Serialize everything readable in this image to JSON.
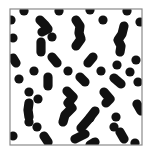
{
  "figure": {
    "kind": "pattern-panel",
    "background_color": "#ffffff",
    "blob_color": "#111111",
    "frame_color": "#8a8a8a",
    "frame": {
      "x": 10,
      "y": 9,
      "width": 132,
      "height": 136
    },
    "blob_radius": 4.6,
    "dots": [
      [
        24,
        11
      ],
      [
        59,
        11
      ],
      [
        90,
        10
      ],
      [
        127,
        11
      ],
      [
        11,
        20
      ],
      [
        13,
        38
      ],
      [
        52,
        37
      ],
      [
        103,
        20
      ],
      [
        140,
        22
      ],
      [
        34,
        71
      ],
      [
        19,
        79
      ],
      [
        68,
        71
      ],
      [
        117,
        65
      ],
      [
        136,
        60
      ],
      [
        130,
        72
      ],
      [
        101,
        71
      ],
      [
        138,
        82
      ],
      [
        29,
        92
      ],
      [
        38,
        99
      ],
      [
        116,
        117
      ],
      [
        90,
        118
      ],
      [
        29,
        122
      ],
      [
        37,
        127
      ],
      [
        13,
        136
      ],
      [
        135,
        143
      ],
      [
        114,
        127
      ]
    ],
    "chains": [
      [
        [
          40,
          20
        ],
        [
          45,
          25
        ],
        [
          48,
          29
        ],
        [
          42,
          32
        ]
      ],
      [
        [
          41,
          42
        ],
        [
          41,
          52
        ]
      ],
      [
        [
          76,
          20
        ],
        [
          80,
          26
        ],
        [
          79,
          33
        ],
        [
          81,
          39
        ],
        [
          76,
          46
        ]
      ],
      [
        [
          124,
          26
        ],
        [
          122,
          34
        ],
        [
          118,
          40
        ],
        [
          121,
          46
        ],
        [
          120,
          52
        ]
      ],
      [
        [
          13,
          58
        ],
        [
          16,
          63
        ]
      ],
      [
        [
          52,
          57
        ],
        [
          57,
          63
        ]
      ],
      [
        [
          93,
          57
        ],
        [
          88,
          63
        ]
      ],
      [
        [
          48,
          77
        ],
        [
          48,
          86
        ]
      ],
      [
        [
          80,
          77
        ],
        [
          85,
          82
        ]
      ],
      [
        [
          114,
          78
        ],
        [
          121,
          84
        ]
      ],
      [
        [
          67,
          91
        ],
        [
          73,
          97
        ],
        [
          68,
          103
        ],
        [
          72,
          108
        ],
        [
          65,
          115
        ],
        [
          63,
          122
        ]
      ],
      [
        [
          104,
          92
        ],
        [
          110,
          99
        ],
        [
          106,
          103
        ]
      ],
      [
        [
          137,
          104
        ],
        [
          141,
          111
        ]
      ],
      [
        [
          29,
          103
        ],
        [
          28,
          110
        ],
        [
          29,
          117
        ]
      ],
      [
        [
          95,
          111
        ],
        [
          88,
          120
        ],
        [
          81,
          128
        ]
      ],
      [
        [
          120,
          132
        ],
        [
          124,
          139
        ]
      ],
      [
        [
          44,
          136
        ],
        [
          48,
          142
        ]
      ],
      [
        [
          95,
          142
        ],
        [
          90,
          145
        ]
      ],
      [
        [
          75,
          139
        ],
        [
          85,
          134
        ]
      ]
    ]
  }
}
